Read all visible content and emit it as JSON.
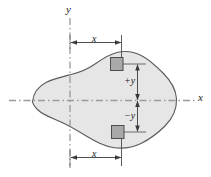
{
  "figure": {
    "background_color": "#ffffff",
    "axes": {
      "y_axis_label": "y",
      "x_axis_label": "x",
      "axis_line_color": "#8a8a8a",
      "axis_style": "dash-dot",
      "origin_x_px": 70,
      "origin_y_px": 100
    },
    "shape": {
      "name": "irregular-blob-cross-section",
      "fill_color": "#e6e6e6",
      "stroke_color": "#5a5a5a"
    },
    "holes": [
      {
        "name": "upper-square-hole",
        "fill_color": "#a9a9a9",
        "stroke_color": "#4d4d4d",
        "position": "above-x-axis"
      },
      {
        "name": "lower-square-hole",
        "fill_color": "#a9a9a9",
        "stroke_color": "#4d4d4d",
        "position": "below-x-axis"
      }
    ],
    "dimensions": {
      "top_x_label": "x",
      "bottom_x_label": "x",
      "plus_y_label": "+y",
      "minus_y_label": "−y",
      "dimension_line_color": "#3a3a3a"
    }
  }
}
